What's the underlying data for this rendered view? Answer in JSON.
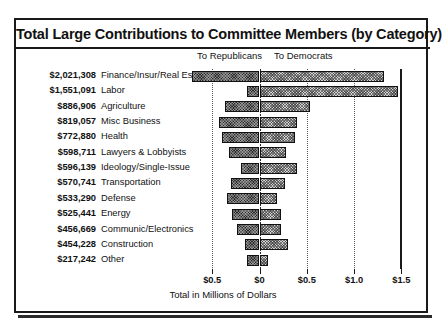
{
  "chart_data": {
    "type": "bar",
    "orientation": "horizontal",
    "stacked": true,
    "title": "Total Large Contributions to Committee Members (by Category)",
    "xlabel": "Total in Millions of Dollars",
    "ylabel": "",
    "grid": true,
    "legend_position": "top",
    "legend": [
      "To Republicans",
      "To Democrats"
    ],
    "xticks": [
      "$0.5",
      "$0",
      "$0.5",
      "$1.0",
      "$1.5"
    ],
    "xtick_values": [
      -0.5,
      0,
      0.5,
      1.0,
      1.5
    ],
    "xlim": [
      -0.5,
      1.5
    ],
    "unit": "millions of dollars",
    "categories": [
      "Finance/Insur/Real Est",
      "Labor",
      "Agriculture",
      "Misc Business",
      "Health",
      "Lawyers & Lobbyists",
      "Ideology/Single-Issue",
      "Transportation",
      "Defense",
      "Energy",
      "Communic/Electronics",
      "Construction",
      "Other"
    ],
    "totals_label": [
      "$2,021,308",
      "$1,551,091",
      "$886,906",
      "$819,057",
      "$772,880",
      "$598,711",
      "$596,139",
      "$570,741",
      "$533,290",
      "$525,441",
      "$456,669",
      "$454,228",
      "$217,242"
    ],
    "totals": [
      2021308,
      1551091,
      886906,
      819057,
      772880,
      598711,
      596139,
      570741,
      533290,
      525441,
      456669,
      454228,
      217242
    ],
    "series": [
      {
        "name": "To Republicans",
        "color": "#2a2a2a",
        "values": [
          -0.715,
          -0.13,
          -0.365,
          -0.43,
          -0.395,
          -0.32,
          -0.195,
          -0.3,
          -0.345,
          -0.295,
          -0.235,
          -0.155,
          -0.135
        ]
      },
      {
        "name": "To Democrats",
        "color": "#d2d2d2",
        "values": [
          1.32,
          1.46,
          0.53,
          0.4,
          0.38,
          0.28,
          0.4,
          0.27,
          0.19,
          0.23,
          0.225,
          0.3,
          0.085
        ]
      }
    ]
  },
  "legend": {
    "republicans": "To Republicans",
    "democrats": "To Democrats"
  }
}
